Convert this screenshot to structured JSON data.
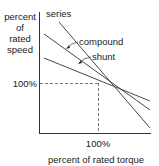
{
  "diagram": {
    "type": "speed-torque characteristic",
    "y_axis_label": [
      "percent",
      "of",
      "rated",
      "speed"
    ],
    "x_axis_label": "percent of rated torque",
    "y_marker": "100%",
    "x_marker": "100%",
    "curves": [
      {
        "name": "series",
        "label": "series"
      },
      {
        "name": "compound",
        "label": "compound"
      },
      {
        "name": "shunt",
        "label": "shunt"
      }
    ],
    "colors": {
      "line": "#333333",
      "dash": "#555555",
      "text": "#222222"
    }
  }
}
